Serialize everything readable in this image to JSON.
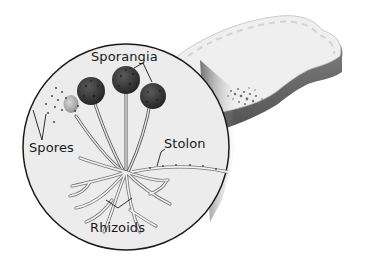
{
  "diagram": {
    "labels": {
      "sporangia": "Sporangia",
      "spores": "Spores",
      "stolon": "Stolon",
      "rhizoids": "Rhizoids"
    },
    "colors": {
      "background": "#ffffff",
      "circle_fill": "#ececec",
      "circle_stroke": "#1a1a1a",
      "sporangium": "#3a3a3a",
      "bread_top": "#eeeeee",
      "bread_crust": "#6e6e6e",
      "mold_patch": "#7a7a7a"
    }
  }
}
